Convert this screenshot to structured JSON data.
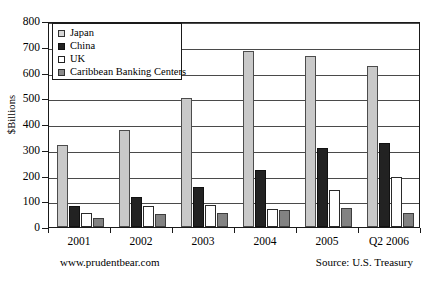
{
  "chart_data": {
    "type": "bar",
    "title": "",
    "xlabel": "",
    "ylabel": "$Billions",
    "ylim": [
      0,
      800
    ],
    "ytick_step": 100,
    "yticks": [
      0,
      100,
      200,
      300,
      400,
      500,
      600,
      700,
      800
    ],
    "grid": true,
    "legend_position": "upper-left-inside",
    "categories": [
      "2001",
      "2002",
      "2003",
      "2004",
      "2005",
      "Q2 2006"
    ],
    "series": [
      {
        "name": "Japan",
        "color": "#c9c9c9",
        "values": [
          318,
          378,
          500,
          685,
          665,
          625
        ]
      },
      {
        "name": "China",
        "color": "#222222",
        "values": [
          80,
          118,
          155,
          220,
          305,
          325
        ]
      },
      {
        "name": "UK",
        "color": "#ffffff",
        "values": [
          55,
          80,
          85,
          70,
          145,
          195
        ]
      },
      {
        "name": "Caribbean Banking Centers",
        "color": "#828282",
        "values": [
          35,
          50,
          55,
          68,
          75,
          55
        ]
      }
    ]
  },
  "legend": {
    "items": [
      {
        "label": "Japan",
        "swatch": "japan"
      },
      {
        "label": "China",
        "swatch": "china"
      },
      {
        "label": "UK",
        "swatch": "uk"
      },
      {
        "label": "Caribbean Banking Centers",
        "swatch": "caribbean"
      }
    ]
  },
  "footer": {
    "left": "www.prudentbear.com",
    "right": "Source: U.S. Treasury"
  }
}
